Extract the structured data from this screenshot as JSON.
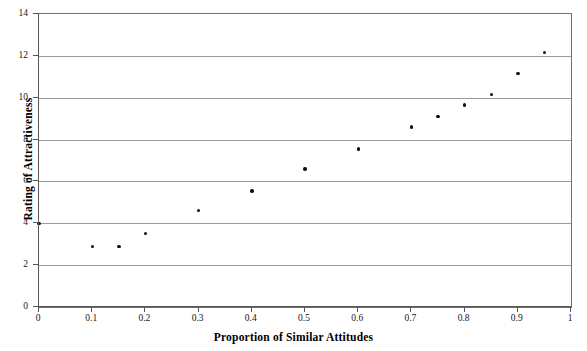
{
  "chart_data": {
    "type": "scatter",
    "title": "",
    "xlabel": "Proportion of Similar Attitudes",
    "ylabel": "Rating of Attractiveness",
    "xlim": [
      0,
      1
    ],
    "ylim": [
      0,
      14
    ],
    "grid": true,
    "legend": null,
    "xticks": [
      "0",
      "0.1",
      "0.2",
      "0.3",
      "0.4",
      "0.5",
      "0.6",
      "0.7",
      "0.8",
      "0.9",
      "1"
    ],
    "xtick_values": [
      0,
      0.1,
      0.2,
      0.3,
      0.4,
      0.5,
      0.6,
      0.7,
      0.8,
      0.9,
      1
    ],
    "yticks": [
      "0",
      "2",
      "4",
      "6",
      "8",
      "10",
      "12",
      "14"
    ],
    "ytick_values": [
      0,
      2,
      4,
      6,
      8,
      10,
      12,
      14
    ],
    "series": [
      {
        "name": "",
        "marker": "filled-circle",
        "color": "#111111",
        "points": [
          {
            "x": 0.0,
            "y": 4.0
          },
          {
            "x": 0.1,
            "y": 2.9
          },
          {
            "x": 0.15,
            "y": 2.9
          },
          {
            "x": 0.2,
            "y": 3.5
          },
          {
            "x": 0.3,
            "y": 4.6
          },
          {
            "x": 0.4,
            "y": 5.55
          },
          {
            "x": 0.5,
            "y": 6.6
          },
          {
            "x": 0.6,
            "y": 7.55
          },
          {
            "x": 0.7,
            "y": 8.6
          },
          {
            "x": 0.75,
            "y": 9.1
          },
          {
            "x": 0.8,
            "y": 9.65
          },
          {
            "x": 0.85,
            "y": 10.15
          },
          {
            "x": 0.9,
            "y": 11.15
          },
          {
            "x": 0.95,
            "y": 12.15
          }
        ]
      }
    ]
  },
  "colors": {
    "marker": "#111111",
    "gridline": "#9a9a9a",
    "axis": "#555555",
    "frame": "#6f6f6f",
    "text": "#151515",
    "background": "#ffffff"
  }
}
